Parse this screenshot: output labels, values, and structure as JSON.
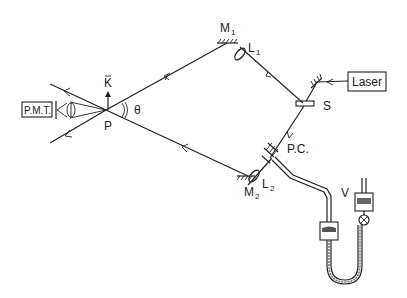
{
  "diagram": {
    "labels": {
      "m1": "M",
      "m1_sub": "1",
      "l1": "L",
      "l1_sub": "1",
      "m2": "M",
      "m2_sub": "2",
      "l2": "L",
      "l2_sub": "2",
      "s": "S",
      "laser": "Laser",
      "pmt": "P.M.T.",
      "p": "P",
      "k": "K",
      "theta": "θ",
      "pc": "P.C.",
      "v": "V"
    },
    "components": [
      "laser",
      "splitter-s",
      "mirror-m1",
      "lens-l1",
      "mirror-m2",
      "lens-l2",
      "pockels-cell-pc",
      "photomultiplier-pmt",
      "interaction-point-p",
      "wave-vector-k",
      "angle-theta",
      "valve-v",
      "u-tube-manometer"
    ]
  }
}
